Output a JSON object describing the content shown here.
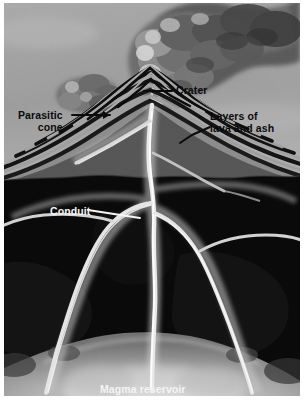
{
  "figure": {
    "kind": "volcano-cross-section-diagram",
    "caption_cutoff": "",
    "palette": {
      "sky": "#9a9a9a",
      "sky_light": "#b4b4b4",
      "plume_dark": "#4a4a4a",
      "plume_mid": "#6e6e6e",
      "plume_light": "#c9c9c9",
      "cone_light": "#8a8a8a",
      "cone_dark": "#1b1b1b",
      "subsurface": "#0a0a0a",
      "magma": "#b9b9b9",
      "conduit_glow": "#d8d8d8",
      "label_dark": "#0b0b0b",
      "label_light": "#f4f4f4",
      "page": "#ffffff"
    }
  },
  "labels": {
    "crater": "Crater",
    "layers_line1": "Layers of",
    "layers_line2": "lava and ash",
    "parasitic_line1": "Parasitic",
    "parasitic_line2": "cone",
    "conduit": "Conduit",
    "magma": "Magma reservoir"
  },
  "parts": {
    "eruption_column": "eruption-column",
    "parasitic_plume": "parasitic-plume",
    "main_cone": "main-cone",
    "strata_bands": "layers-of-lava-and-ash",
    "ground_surface": "ground-surface",
    "central_conduit": "central-conduit",
    "parasitic_conduit": "parasitic-conduit",
    "left_conduit": "left-branch-conduit",
    "right_conduit": "right-branch-conduit",
    "magma_reservoir": "magma-reservoir"
  }
}
